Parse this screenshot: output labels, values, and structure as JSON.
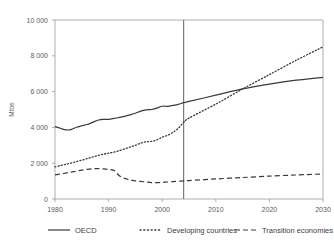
{
  "title_partial": "",
  "axis": {
    "ylabel": "Mtoe",
    "xlabel": "",
    "y_ticks": [
      "0",
      "2 000",
      "4 000",
      "6 000",
      "8 000",
      "10 000"
    ],
    "x_ticks": [
      "1980",
      "1990",
      "2000",
      "2010",
      "2020",
      "2030"
    ]
  },
  "legend": {
    "items": [
      {
        "label": "OECD",
        "style": "solid"
      },
      {
        "label": "Developing countries",
        "style": "dotted"
      },
      {
        "label": "Transition economies",
        "style": "dashed"
      }
    ]
  },
  "annotations": {
    "projection_divider_year": 2004
  },
  "chart_data": {
    "type": "line",
    "title": "",
    "xlabel": "",
    "ylabel": "Mtoe",
    "xlim": [
      1980,
      2030
    ],
    "ylim": [
      0,
      10000
    ],
    "y_ticks": [
      0,
      2000,
      4000,
      6000,
      8000,
      10000
    ],
    "x_ticks": [
      1980,
      1990,
      2000,
      2010,
      2020,
      2030
    ],
    "grid": false,
    "legend_position": "bottom",
    "projection_divider_year": 2004,
    "x": [
      1980,
      1981,
      1982,
      1983,
      1984,
      1985,
      1986,
      1987,
      1988,
      1989,
      1990,
      1991,
      1992,
      1993,
      1994,
      1995,
      1996,
      1997,
      1998,
      1999,
      2000,
      2001,
      2002,
      2003,
      2004,
      2005,
      2010,
      2015,
      2020,
      2025,
      2030
    ],
    "series": [
      {
        "name": "OECD",
        "style": "solid",
        "values": [
          4050,
          3950,
          3860,
          3880,
          4010,
          4090,
          4160,
          4280,
          4400,
          4450,
          4450,
          4500,
          4560,
          4620,
          4700,
          4790,
          4910,
          4980,
          5000,
          5080,
          5180,
          5180,
          5230,
          5290,
          5380,
          5450,
          5800,
          6150,
          6420,
          6640,
          6800
        ]
      },
      {
        "name": "Developing countries",
        "style": "dotted",
        "values": [
          1800,
          1870,
          1940,
          2010,
          2090,
          2170,
          2260,
          2340,
          2430,
          2500,
          2560,
          2620,
          2700,
          2800,
          2900,
          3000,
          3120,
          3200,
          3220,
          3300,
          3450,
          3560,
          3720,
          3950,
          4280,
          4520,
          5300,
          6150,
          6950,
          7750,
          8500
        ]
      },
      {
        "name": "Transition economies",
        "style": "dashed",
        "values": [
          1350,
          1400,
          1450,
          1500,
          1560,
          1610,
          1660,
          1690,
          1700,
          1680,
          1650,
          1600,
          1300,
          1150,
          1070,
          1010,
          980,
          950,
          920,
          910,
          930,
          950,
          970,
          990,
          1010,
          1030,
          1120,
          1200,
          1280,
          1340,
          1400
        ]
      }
    ]
  }
}
